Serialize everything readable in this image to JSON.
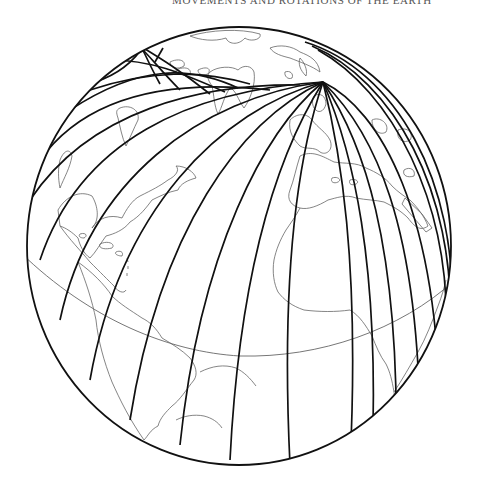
{
  "page": {
    "running_head": "Movements and Rotations of the Earth"
  },
  "figure": {
    "projection": "orthographic",
    "globe": {
      "cx": 239,
      "cy": 246,
      "rx": 212,
      "ry": 219
    },
    "convergence_point": {
      "x": 323,
      "y": 82
    },
    "secondary_convergence": {
      "x": 137,
      "y": 44
    },
    "colors": {
      "tracks": "#111111",
      "coastlines": "#666666",
      "equator": "#666666",
      "background": "#ffffff"
    },
    "visible_regions": [
      "North America",
      "Greenland",
      "Europe",
      "Africa",
      "South America",
      "Caribbean",
      "Mediterranean",
      "Arabian Peninsula"
    ]
  }
}
